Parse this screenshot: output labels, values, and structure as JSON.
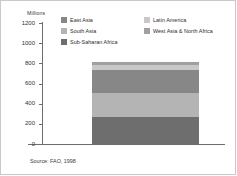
{
  "chart_data": {
    "type": "bar",
    "title": "",
    "subtitle": "",
    "unit_label": "Millions",
    "xlabel": "",
    "ylabel": "Millions",
    "ylim": [
      0,
      1200
    ],
    "ytick_labels": [
      "1200",
      "1000",
      "800",
      "600",
      "400",
      "200",
      "0"
    ],
    "ytick_values": [
      1200,
      1000,
      800,
      600,
      400,
      200,
      0
    ],
    "grid": false,
    "legend_position": "top",
    "categories": [
      "Undernourished people"
    ],
    "stacked": true,
    "total": 810,
    "series": [
      {
        "name": "Sub-Saharan Africa",
        "values": [
          270
        ],
        "color": "#6e6e6e"
      },
      {
        "name": "South Asia",
        "values": [
          240
        ],
        "color": "#b4b4b4"
      },
      {
        "name": "East Asia",
        "values": [
          220
        ],
        "color": "#878787"
      },
      {
        "name": "Latin America",
        "values": [
          55
        ],
        "color": "#c8c8c8"
      },
      {
        "name": "West Asia & North Africa",
        "values": [
          25
        ],
        "color": "#a0a0a0"
      }
    ],
    "source": "Source: FAO, 1998"
  },
  "legend": {
    "left_column": [
      {
        "label": "East Asia",
        "color": "#878787"
      },
      {
        "label": "South Asia",
        "color": "#b4b4b4"
      },
      {
        "label": "Sub-Saharan Africa",
        "color": "#6e6e6e"
      }
    ],
    "right_column": [
      {
        "label": "Latin America",
        "color": "#c8c8c8"
      },
      {
        "label": "West Asia & North Africa",
        "color": "#a0a0a0"
      }
    ]
  },
  "colors": {
    "axis": "#6e6e6e",
    "border": "#c9c9c9",
    "text": "#2b2b2b",
    "background": "#ffffff"
  }
}
